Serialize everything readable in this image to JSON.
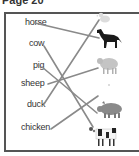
{
  "page": {
    "title": "Page 20"
  },
  "labels": {
    "horse": "horse",
    "cow": "cow",
    "pig": "pig",
    "sheep": "sheep",
    "duck": "duck",
    "chicken": "chicken"
  },
  "animals": [
    {
      "name": "duck",
      "icon": "duck-icon",
      "color": "#d8d8d8"
    },
    {
      "name": "horse",
      "icon": "horse-icon",
      "color": "#1a1a1a"
    },
    {
      "name": "sheep",
      "icon": "sheep-icon",
      "color": "#bdbdbd"
    },
    {
      "name": "pig",
      "icon": "pig-icon",
      "color": "#8a8a8a"
    },
    {
      "name": "cow",
      "icon": "cow-icon",
      "color": "#222222"
    }
  ],
  "line_color": "#8a8a8a"
}
